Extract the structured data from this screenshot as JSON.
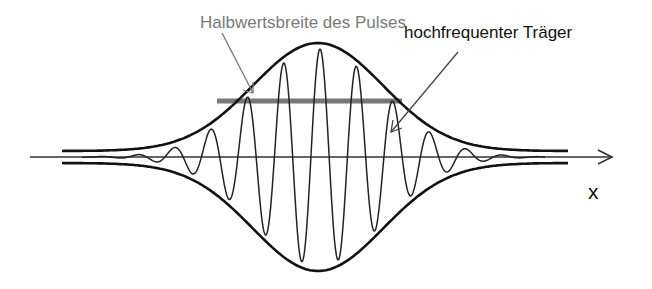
{
  "figure": {
    "labels": {
      "fwhm": "Halbwertsbreite des Pulses",
      "carrier": "hochfrequenter Träger",
      "axis": "x"
    },
    "colors": {
      "envelope": "#111111",
      "carrier": "#222222",
      "axis": "#333333",
      "fwhm_bar": "#777777",
      "fwhm_label": "#7a7a7a",
      "text": "#111111"
    },
    "geometry": {
      "axis_y": 157,
      "axis_x_start": 30,
      "axis_x_end": 612,
      "center_x": 318,
      "envelope_amplitude": 114,
      "envelope_sigma": 92,
      "envelope_offset": 6,
      "envelope_x_start": 62,
      "envelope_x_end": 568,
      "carrier_period": 36.5,
      "carrier_x_start": 82,
      "carrier_x_end": 545,
      "fwhm_bar": {
        "x1": 217,
        "x2": 402,
        "y": 101
      }
    }
  }
}
